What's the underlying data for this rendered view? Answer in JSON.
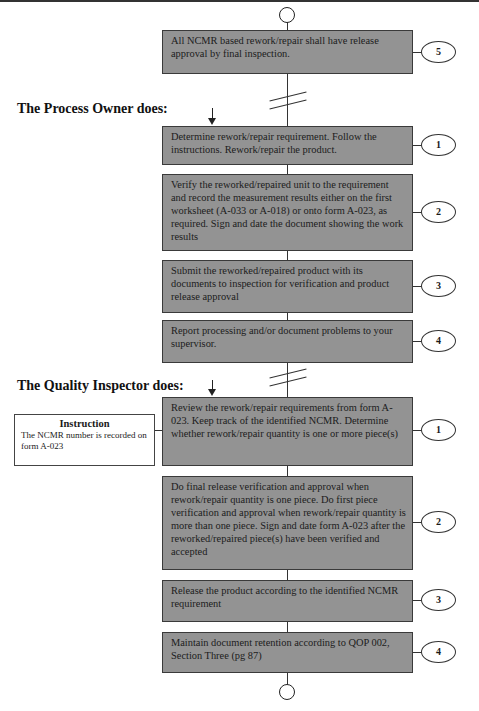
{
  "diagram": {
    "start_terminal": "start-circle",
    "end_terminal": "end-circle",
    "intro_step": {
      "text": "All NCMR based rework/repair shall have release approval by final inspection.",
      "number": "5"
    },
    "sections": [
      {
        "heading": "The Process Owner does:",
        "steps": [
          {
            "text": "Determine rework/repair requirement. Follow the instructions. Rework/repair the product.",
            "number": "1"
          },
          {
            "text": "Verify the reworked/repaired unit to the requirement and record the measurement results either on the first worksheet (A-033 or A-018) or onto form A-023, as required. Sign and date the document showing the work results",
            "number": "2"
          },
          {
            "text": "Submit the reworked/repaired product with its documents to inspection for verification and product release approval",
            "number": "3"
          },
          {
            "text": "Report processing and/or document problems to your supervisor.",
            "number": "4"
          }
        ]
      },
      {
        "heading": "The Quality Inspector does:",
        "steps": [
          {
            "text": "Review the rework/repair requirements from form A-023. Keep track of the identified NCMR. Determine whether rework/repair quantity is one or more piece(s)",
            "number": "1"
          },
          {
            "text": "Do final release verification and approval when rework/repair quantity is one piece. Do first piece verification and approval when rework/repair quantity is more than one piece. Sign and date form A-023 after the reworked/repaired piece(s) have been verified and accepted",
            "number": "2"
          },
          {
            "text": "Release the product according to the identified NCMR requirement",
            "number": "3"
          },
          {
            "text": "Maintain document retention according to QOP 002, Section Three (pg 87)",
            "number": "4"
          }
        ],
        "note": {
          "title": "Instruction",
          "text": "The NCMR number is recorded on form A-023"
        }
      }
    ],
    "colors": {
      "box_fill": "#939393",
      "box_border": "#3a3a3a",
      "line": "#333333",
      "background": "#ffffff"
    }
  }
}
